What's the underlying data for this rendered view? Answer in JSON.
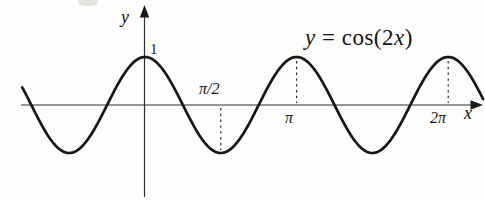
{
  "figure": {
    "background": "#fdfdfb",
    "ink_color": "#161616",
    "axis_labels": {
      "x": "x",
      "y": "y"
    },
    "tick_labels": {
      "one": "1",
      "half_pi": "π/2",
      "pi": "π",
      "two_pi": "2π"
    },
    "equation": {
      "lhs": "y",
      "rel": " = ",
      "fn": "cos(2",
      "arg": "x",
      "close": ")"
    }
  },
  "chart_data": {
    "type": "line",
    "title": "y = cos(2x)",
    "annotation": "y = cos(2x)",
    "xlabel": "x",
    "ylabel": "y",
    "expression": "cos(2x)",
    "amplitude": 1,
    "frequency_multiplier": 2,
    "x_range_pi": [
      -0.81,
      2.235
    ],
    "ylim": [
      -1,
      1
    ],
    "grid": false,
    "legend": false,
    "x_ticks": [
      {
        "value_pi": 0.5,
        "label": "π/2"
      },
      {
        "value_pi": 1,
        "label": "π"
      },
      {
        "value_pi": 2,
        "label": "2π"
      }
    ],
    "y_ticks": [
      {
        "value": 1,
        "label": "1"
      }
    ],
    "key_points": [
      {
        "x": "0",
        "y": 1
      },
      {
        "x": "-π/2",
        "y": -1
      },
      {
        "x": "π/2",
        "y": -1
      },
      {
        "x": "π",
        "y": 1
      },
      {
        "x": "3π/2",
        "y": -1
      },
      {
        "x": "2π",
        "y": 1
      }
    ],
    "guides": [
      {
        "x_pi": 0.5,
        "y": -1
      },
      {
        "x_pi": 1,
        "y": 1
      },
      {
        "x_pi": 2,
        "y": 1
      }
    ]
  }
}
